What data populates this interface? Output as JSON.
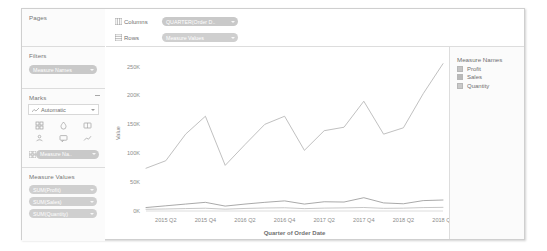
{
  "sidebar": {
    "pages": {
      "title": "Pages"
    },
    "filters": {
      "title": "Filters",
      "pills": [
        {
          "label": "Measure Names",
          "icon": "filter-pill"
        }
      ]
    },
    "marks": {
      "title": "Marks",
      "mark_type": "Automatic",
      "buttons": [
        {
          "name": "color-button",
          "label": "Color"
        },
        {
          "name": "size-button",
          "label": "Size"
        },
        {
          "name": "label-button",
          "label": "Label"
        },
        {
          "name": "detail-button",
          "label": "Detail"
        },
        {
          "name": "tooltip-button",
          "label": "Tooltip"
        },
        {
          "name": "path-button",
          "label": "Path"
        }
      ],
      "encoding_pills": [
        {
          "label": "Measure Na..",
          "icon": "color-legend-pill"
        }
      ]
    },
    "measure_values": {
      "title": "Measure Values",
      "pills": [
        {
          "label": "SUM(Profit)"
        },
        {
          "label": "SUM(Sales)"
        },
        {
          "label": "SUM(Quantity)"
        }
      ]
    }
  },
  "shelves": {
    "columns": {
      "label": "Columns",
      "pill": "QUARTER(Order D..",
      "icon": "columns-icon"
    },
    "rows": {
      "label": "Rows",
      "pill": "Measure Values",
      "icon": "rows-icon"
    }
  },
  "legend": {
    "title": "Measure Names",
    "items": [
      {
        "label": "Profit",
        "color": "#c4c4c4"
      },
      {
        "label": "Sales",
        "color": "#b9b9b9"
      },
      {
        "label": "Quantity",
        "color": "#c9c9c9"
      }
    ]
  },
  "chart_data": {
    "type": "line",
    "title": "",
    "xlabel": "Quarter of Order Date",
    "ylabel": "Value",
    "grid": false,
    "legend_position": "right",
    "ylim": [
      0,
      270000
    ],
    "yticks": [
      0,
      50000,
      100000,
      150000,
      200000,
      250000
    ],
    "ytick_labels": [
      "0K",
      "50K",
      "100K",
      "150K",
      "200K",
      "250K"
    ],
    "x": [
      "2015 Q1",
      "2015 Q2",
      "2015 Q3",
      "2015 Q4",
      "2016 Q1",
      "2016 Q2",
      "2016 Q3",
      "2016 Q4",
      "2017 Q1",
      "2017 Q2",
      "2017 Q3",
      "2017 Q4",
      "2018 Q1",
      "2018 Q2",
      "2018 Q3",
      "2018 Q4"
    ],
    "xtick_labels": [
      "2015 Q2",
      "2015 Q4",
      "2016 Q2",
      "2016 Q4",
      "2017 Q2",
      "2017 Q4",
      "2018 Q2",
      "2018 Q4"
    ],
    "xtick_indices": [
      1,
      3,
      5,
      7,
      9,
      11,
      13,
      15
    ],
    "series": [
      {
        "name": "Sales",
        "color": "#b5b5b5",
        "values": [
          74000,
          87000,
          133000,
          164000,
          79000,
          115000,
          150000,
          164000,
          105000,
          139000,
          145000,
          190000,
          133000,
          144000,
          203000,
          255000
        ]
      },
      {
        "name": "Quantity",
        "color": "#9a9a9a",
        "values": [
          6000,
          9000,
          12000,
          15000,
          8500,
          12000,
          15000,
          17500,
          12000,
          16000,
          15500,
          23000,
          14000,
          12500,
          18000,
          19000
        ]
      },
      {
        "name": "Profit",
        "color": "#bdbdbd",
        "values": [
          3000,
          3500,
          4200,
          4800,
          3200,
          4400,
          5200,
          5600,
          4100,
          5000,
          5400,
          6100,
          4600,
          4900,
          5900,
          6300
        ]
      }
    ]
  }
}
